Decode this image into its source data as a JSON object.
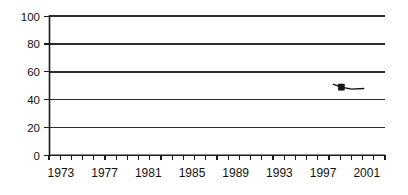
{
  "chart_data": {
    "type": "line",
    "title": "",
    "subtitle": "",
    "xlabel": "",
    "ylabel": "",
    "xlim": [
      1972,
      2002
    ],
    "ylim": [
      0,
      100
    ],
    "grid": true,
    "legend": "none",
    "y_ticks": [
      "0",
      "20",
      "40",
      "60",
      "80",
      "100"
    ],
    "y_tick_values": [
      0,
      20,
      40,
      60,
      80,
      100
    ],
    "x_ticks": [
      "1973",
      "1977",
      "1981",
      "1985",
      "1989",
      "1993",
      "1997",
      "2001"
    ],
    "x_tick_values": [
      1973,
      1977,
      1981,
      1985,
      1989,
      1993,
      1997,
      2001
    ],
    "x_minor_tick_values": [
      1972,
      1973,
      1974,
      1975,
      1976,
      1977,
      1978,
      1979,
      1980,
      1981,
      1982,
      1983,
      1984,
      1985,
      1986,
      1987,
      1988,
      1989,
      1990,
      1991,
      1992,
      1993,
      1994,
      1995,
      1996,
      1997,
      1998,
      1999,
      2000,
      2001,
      2002
    ],
    "series": [
      {
        "name": "series-1",
        "marker": "square",
        "color": "#161616",
        "x": [
          1997.4,
          1998.1,
          1999.0,
          2000.1
        ],
        "values": [
          51,
          49,
          47.5,
          48
        ]
      }
    ],
    "colors": {
      "axis": "#1a1a1a",
      "grid": "#2b2b2b",
      "series": "#161616",
      "background": "#ffffff",
      "text": "#111111"
    }
  }
}
